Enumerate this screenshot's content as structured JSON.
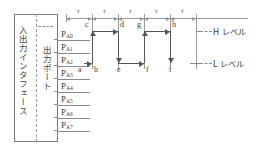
{
  "diagram": {
    "title_text": "",
    "block": {
      "interface_label": "入出力インタフェース",
      "port_label": "出力ポート",
      "pins": [
        {
          "base": "P",
          "sub": "A0"
        },
        {
          "base": "P",
          "sub": "A1"
        },
        {
          "base": "P",
          "sub": "A2"
        },
        {
          "base": "P",
          "sub": "A3"
        },
        {
          "base": "P",
          "sub": "A4"
        },
        {
          "base": "P",
          "sub": "A5"
        },
        {
          "base": "P",
          "sub": "A6"
        },
        {
          "base": "P",
          "sub": "A7"
        }
      ]
    },
    "timing": {
      "tau_symbol": "τ",
      "tau_count": 5,
      "h_level_label": "H レベル",
      "l_level_label": "L レベル",
      "points": [
        {
          "id": "a",
          "level": "L"
        },
        {
          "id": "b",
          "level": "L"
        },
        {
          "id": "c",
          "level": "H"
        },
        {
          "id": "d",
          "level": "H"
        },
        {
          "id": "e",
          "level": "L"
        },
        {
          "id": "f",
          "level": "L"
        },
        {
          "id": "g",
          "level": "H"
        },
        {
          "id": "h",
          "level": "H"
        },
        {
          "id": "i",
          "level": "L"
        }
      ]
    },
    "colors": {
      "line": "#555555",
      "guide": "#9a9a9a",
      "text": "#3a3a3a",
      "background": "#ffffff"
    }
  }
}
